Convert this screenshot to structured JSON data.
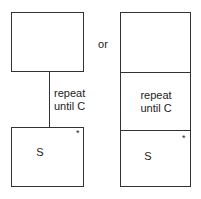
{
  "left": {
    "label": "repeat",
    "label2": "until C",
    "body": "S",
    "marker": "*"
  },
  "separator": "or",
  "right": {
    "label": "repeat",
    "label2": "until C",
    "body": "S",
    "marker": "*"
  }
}
